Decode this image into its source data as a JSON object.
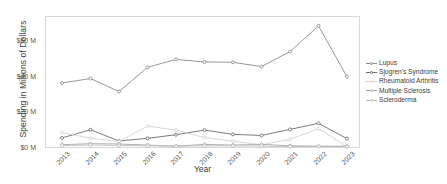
{
  "chart_data": {
    "type": "line",
    "title": "",
    "xlabel": "Year",
    "ylabel": "Spending in Millions of Dollars",
    "categories": [
      "2013",
      "2014",
      "2015",
      "2016",
      "2017",
      "2018",
      "2019",
      "2020",
      "2021",
      "2022",
      "2023"
    ],
    "x_tick_labels": [
      "2013",
      "2014",
      "2015",
      "2016",
      "2017",
      "2018",
      "2019",
      "2020",
      "2021",
      "2022",
      "2023"
    ],
    "y_tick_labels": [
      "$0 M",
      "$20 M",
      "$40 M",
      "$60 M"
    ],
    "y_tick_values": [
      0,
      20,
      60,
      60
    ],
    "yticks": [
      0,
      20,
      40,
      60
    ],
    "ylim": [
      0,
      74
    ],
    "grid": false,
    "legend_position": "right",
    "units": "Millions of Dollars",
    "series": [
      {
        "name": "Lupus",
        "color": "#8c8c8c",
        "values": [
          37.0,
          39.5,
          32.2,
          45.8,
          50.2,
          48.8,
          48.6,
          46.2,
          54.6,
          69.0,
          40.5
        ]
      },
      {
        "name": "Sjogren's Syndrome",
        "color": "#6e6e6e",
        "values": [
          6.2,
          10.8,
          4.5,
          6.0,
          8.0,
          10.6,
          8.2,
          7.6,
          11.0,
          14.4,
          5.8
        ]
      },
      {
        "name": "Rheumatoid Arthritis",
        "color": "#d2d2d2",
        "values": [
          9.2,
          6.0,
          4.2,
          12.8,
          10.6,
          6.4,
          4.4,
          2.4,
          5.4,
          11.4,
          1.4
        ]
      },
      {
        "name": "Multiple Sclerosis",
        "color": "#a8a8a8",
        "values": [
          2.4,
          3.0,
          2.8,
          2.2,
          1.6,
          2.6,
          2.2,
          2.6,
          1.8,
          1.6,
          1.6
        ]
      },
      {
        "name": "Scleroderma",
        "color": "#bcbcbc",
        "values": [
          2.0,
          2.2,
          2.0,
          1.8,
          1.6,
          1.8,
          1.8,
          1.6,
          1.4,
          1.4,
          1.2
        ]
      }
    ]
  },
  "legend": {
    "items": [
      {
        "label": "Lupus"
      },
      {
        "label": "Sjogren's Syndrome"
      },
      {
        "label": "Rheumatoid Arthritis"
      },
      {
        "label": "Multiple Sclerosis"
      },
      {
        "label": "Scleroderma"
      }
    ]
  }
}
